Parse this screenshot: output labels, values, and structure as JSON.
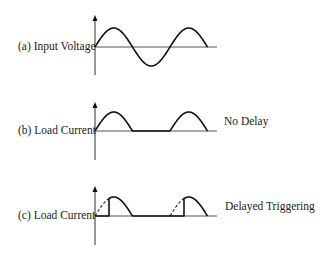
{
  "diagram": {
    "panels": [
      {
        "id": "a",
        "label": "(a) Input Voltage",
        "annotation": "",
        "waveform": "full-sine",
        "axis_x": 95,
        "baseline_y": 47,
        "amplitude": 19,
        "arrow_top_y": 15,
        "axis_bottom_y": 75,
        "period_px": 75,
        "cycles": 1.5,
        "baseline_end_x": 217,
        "label_pos": {
          "x": 18,
          "y": 41
        }
      },
      {
        "id": "b",
        "label": "(b) Load Current",
        "annotation": "No Delay",
        "waveform": "half-wave-rectified",
        "axis_x": 95,
        "baseline_y": 131,
        "amplitude": 19,
        "arrow_top_y": 102,
        "axis_bottom_y": 160,
        "period_px": 75,
        "cycles": 1.5,
        "baseline_end_x": 217,
        "label_pos": {
          "x": 18,
          "y": 125
        },
        "annotation_pos": {
          "x": 224,
          "y": 116
        }
      },
      {
        "id": "c",
        "label": "(c) Load Current",
        "annotation": "Delayed Triggering",
        "waveform": "phase-controlled-half-wave",
        "axis_x": 95,
        "baseline_y": 216,
        "amplitude": 19,
        "arrow_top_y": 186,
        "axis_bottom_y": 245,
        "period_px": 75,
        "cycles": 1.5,
        "firing_delay_px": 14,
        "baseline_end_x": 217,
        "label_pos": {
          "x": 18,
          "y": 210
        },
        "annotation_pos": {
          "x": 225,
          "y": 201
        }
      }
    ],
    "colors": {
      "background": "#ffffff",
      "line": "#111111",
      "text": "#222222"
    }
  }
}
